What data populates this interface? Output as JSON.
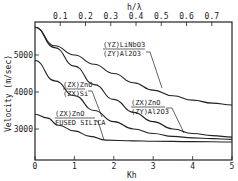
{
  "chart_data": {
    "type": "line",
    "title": "",
    "xlabel": "Kh",
    "ylabel": "Velocity (m/sec)",
    "x2label": "h/λ",
    "xlim": [
      0,
      5
    ],
    "ylim": [
      2200,
      5850
    ],
    "xticks": [
      "0",
      "1",
      "2",
      "3",
      "4",
      "5"
    ],
    "yticks": [
      "3000",
      "4000",
      "5000"
    ],
    "x2ticks": [
      "0.1",
      "0.2",
      "0.3",
      "0.4",
      "0.5",
      "0.6",
      "0.7"
    ],
    "grid": false,
    "series": [
      {
        "name": "(YZ)LiNbO3 / (ZY)Al2O3",
        "x": [
          0,
          0.5,
          1,
          1.5,
          2,
          2.5,
          3,
          3.5,
          4,
          4.5,
          5
        ],
        "values": [
          5750,
          5250,
          5000,
          4750,
          4500,
          4250,
          4050,
          3900,
          3780,
          3700,
          3650
        ]
      },
      {
        "name": "(ZX)ZnO / (ZY)Al2O3",
        "x": [
          0,
          0.5,
          1,
          1.5,
          2,
          2.5,
          3,
          3.5,
          4,
          4.5,
          5
        ],
        "values": [
          5750,
          5200,
          4700,
          4200,
          3800,
          3450,
          3200,
          3000,
          2880,
          2820,
          2780
        ]
      },
      {
        "name": "(ZX)ZnO / (ZX)Si",
        "x": [
          0,
          0.5,
          1,
          1.5,
          2,
          2.5,
          3,
          3.5,
          4,
          4.5,
          5
        ],
        "values": [
          4850,
          4300,
          3900,
          3500,
          3200,
          3000,
          2880,
          2800,
          2760,
          2740,
          2720
        ]
      },
      {
        "name": "(ZX)ZnO / FUSED SILICA",
        "x": [
          0,
          0.3,
          0.6,
          1,
          1.4,
          1.8,
          2.5,
          3,
          4,
          5
        ],
        "values": [
          3400,
          3300,
          3100,
          2950,
          2800,
          2700,
          2680,
          2670,
          2660,
          2650
        ]
      }
    ],
    "annotations": [
      "(YZ)LiNbO3/(ZY)Al2O3",
      "(ZX)ZnO/(ZX)Si",
      "(ZX)ZnO/(ZY)Al2O3",
      "(ZX)ZnO/FUSED SILICA"
    ]
  },
  "labels": {
    "ylabel": "Velocity (m/sec)",
    "xlabel": "Kh",
    "x2label": "h/λ",
    "lab1a": "(YZ)LiNbO3",
    "lab1b": "(ZY)Al2O3",
    "lab2a": "(ZX)ZnO",
    "lab2b": "(ZX)Si",
    "lab3a": "(ZX)ZnO",
    "lab3b": "(ZY)Al2O3",
    "lab4a": "(ZX)ZnO",
    "lab4b": "FUSED SILICA"
  }
}
